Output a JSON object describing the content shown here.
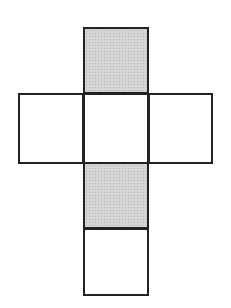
{
  "diagram": {
    "title": "",
    "type": "cube-net",
    "colors": {
      "stroke": "#222222",
      "fill_blank": "#ffffff",
      "fill_shaded": "#d2d2d2"
    },
    "faces": [
      {
        "id": "top",
        "row": 0,
        "col": 1,
        "shaded": true,
        "x": 83,
        "y": 27,
        "w": 66,
        "h": 67
      },
      {
        "id": "left",
        "row": 1,
        "col": 0,
        "shaded": false,
        "x": 18,
        "y": 93,
        "w": 66,
        "h": 71
      },
      {
        "id": "center",
        "row": 1,
        "col": 1,
        "shaded": false,
        "x": 83,
        "y": 93,
        "w": 66,
        "h": 71
      },
      {
        "id": "right",
        "row": 1,
        "col": 2,
        "shaded": false,
        "x": 148,
        "y": 93,
        "w": 65,
        "h": 71
      },
      {
        "id": "lower",
        "row": 2,
        "col": 1,
        "shaded": true,
        "x": 83,
        "y": 162,
        "w": 66,
        "h": 67
      },
      {
        "id": "bottom",
        "row": 3,
        "col": 1,
        "shaded": false,
        "x": 83,
        "y": 228,
        "w": 66,
        "h": 68
      }
    ]
  }
}
